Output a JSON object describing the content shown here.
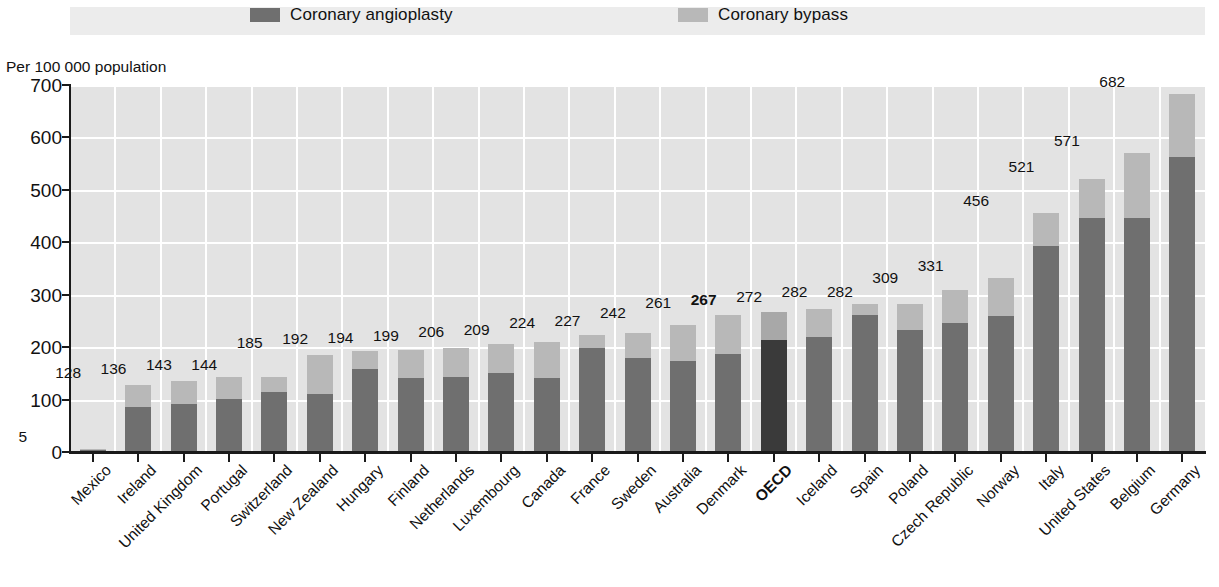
{
  "legend": {
    "items": [
      {
        "label": "Coronary angioplasty",
        "color": "#6f6f6f",
        "icon": "legend-swatch-icon"
      },
      {
        "label": "Coronary bypass",
        "color": "#b8b8b8",
        "icon": "legend-swatch-icon"
      }
    ]
  },
  "axis_title": "Per 100 000 population",
  "chart_data": {
    "type": "bar",
    "subtype": "stacked-bar",
    "title": "",
    "subtitle": "",
    "xlabel": "",
    "ylabel": "Per 100 000 population",
    "ylim": [
      0,
      700
    ],
    "yticks": [
      0,
      100,
      200,
      300,
      400,
      500,
      600,
      700
    ],
    "grid": true,
    "legend_position": "top",
    "highlight_category": "OECD",
    "categories": [
      "Mexico",
      "Ireland",
      "United Kingdom",
      "Portugal",
      "Switzerland",
      "New Zealand",
      "Hungary",
      "Finland",
      "Netherlands",
      "Luxembourg",
      "Canada",
      "France",
      "Sweden",
      "Australia",
      "Denmark",
      "OECD",
      "Iceland",
      "Spain",
      "Poland",
      "Czech Republic",
      "Norway",
      "Italy",
      "United States",
      "Belgium",
      "Germany"
    ],
    "series": [
      {
        "name": "Coronary angioplasty",
        "color": "#6f6f6f",
        "values": [
          3,
          86,
          92,
          102,
          115,
          110,
          158,
          141,
          144,
          150,
          141,
          198,
          179,
          173,
          187,
          213,
          219,
          262,
          233,
          247,
          259,
          392,
          447,
          446,
          562
        ]
      },
      {
        "name": "Coronary bypass",
        "color": "#b8b8b8",
        "values": [
          2,
          42,
          44,
          41,
          29,
          75,
          34,
          53,
          55,
          56,
          68,
          26,
          48,
          69,
          74,
          54,
          53,
          20,
          49,
          62,
          72,
          64,
          74,
          125,
          120
        ]
      }
    ],
    "totals": [
      5,
      128,
      136,
      143,
      144,
      185,
      192,
      194,
      199,
      206,
      209,
      224,
      227,
      242,
      261,
      267,
      272,
      282,
      282,
      309,
      331,
      456,
      521,
      571,
      682
    ],
    "data_labels": [
      "5",
      "128",
      "136",
      "143",
      "144",
      "185",
      "192",
      "194",
      "199",
      "206",
      "209",
      "224",
      "227",
      "242",
      "261",
      "267",
      "272",
      "282",
      "282",
      "309",
      "331",
      "456",
      "521",
      "571",
      "682"
    ]
  },
  "colors": {
    "plot_background": "#e3e3e3",
    "gridline": "#ffffff",
    "legend_band": "#ececec",
    "axis": "#1a1a1a",
    "angioplasty": "#6f6f6f",
    "bypass": "#b8b8b8",
    "highlight_angioplasty": "#3a3a3a",
    "highlight_bypass": "#a8a8a8"
  }
}
